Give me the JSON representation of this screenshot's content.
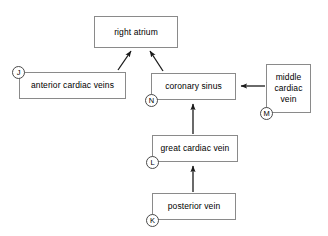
{
  "diagram": {
    "stroke_color": "#8a8a8a",
    "arrow_color": "#1a1a1a",
    "marker_color": "#4a4a4a",
    "background": "#ffffff",
    "nodes": [
      {
        "id": "right-atrium",
        "label": "right atrium",
        "x": 94,
        "y": 16,
        "w": 84,
        "h": 32
      },
      {
        "id": "anterior-cardiac-veins",
        "label": "anterior cardiac veins",
        "x": 19,
        "y": 72,
        "w": 107,
        "h": 27
      },
      {
        "id": "coronary-sinus",
        "label": "coronary sinus",
        "x": 151,
        "y": 73,
        "w": 85,
        "h": 27
      },
      {
        "id": "middle-cardiac-vein",
        "label": "middle cardiac vein",
        "x": 266,
        "y": 64,
        "w": 45,
        "h": 49
      },
      {
        "id": "great-cardiac-vein",
        "label": "great cardiac vein",
        "x": 152,
        "y": 135,
        "w": 86,
        "h": 27
      },
      {
        "id": "posterior-vein",
        "label": "posterior vein",
        "x": 152,
        "y": 193,
        "w": 84,
        "h": 27
      }
    ],
    "markers": [
      {
        "id": "marker-j",
        "label": "J",
        "cx": 19,
        "cy": 72,
        "for": "anterior-cardiac-veins"
      },
      {
        "id": "marker-n",
        "label": "N",
        "cx": 152,
        "cy": 100,
        "for": "coronary-sinus"
      },
      {
        "id": "marker-m",
        "label": "M",
        "cx": 267,
        "cy": 113,
        "for": "middle-cardiac-vein"
      },
      {
        "id": "marker-l",
        "label": "L",
        "cx": 153,
        "cy": 162,
        "for": "great-cardiac-vein"
      },
      {
        "id": "marker-k",
        "label": "K",
        "cx": 153,
        "cy": 220,
        "for": "posterior-vein"
      }
    ],
    "edges": [
      {
        "id": "edge-anterior-to-atrium",
        "from": "anterior-cardiac-veins",
        "to": "right-atrium"
      },
      {
        "id": "edge-sinus-to-atrium",
        "from": "coronary-sinus",
        "to": "right-atrium"
      },
      {
        "id": "edge-middle-to-sinus",
        "from": "middle-cardiac-vein",
        "to": "coronary-sinus"
      },
      {
        "id": "edge-great-to-sinus",
        "from": "great-cardiac-vein",
        "to": "coronary-sinus"
      },
      {
        "id": "edge-posterior-to-great",
        "from": "posterior-vein",
        "to": "great-cardiac-vein"
      }
    ]
  }
}
